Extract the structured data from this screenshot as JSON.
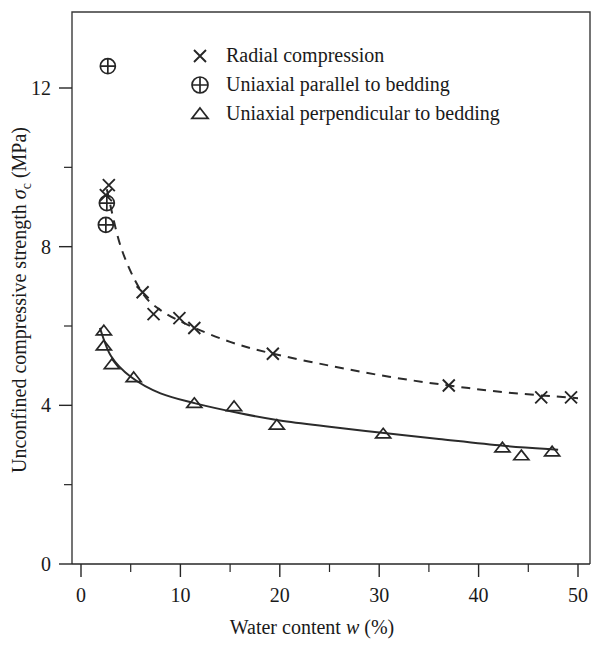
{
  "chart_data": {
    "type": "scatter",
    "title": "",
    "xlabel": "Water content w (%)",
    "xlabel_parts": {
      "pre": "Water content ",
      "italic": "w",
      "post": " (%)"
    },
    "ylabel": "Unconfined compressive strength σc (MPa)",
    "ylabel_parts": {
      "pre": "Unconfined compressive strength ",
      "symbol": "σ",
      "subscript": "c",
      "post": " (MPa)"
    },
    "xlim": [
      0,
      50
    ],
    "ylim": [
      0,
      13.4
    ],
    "x_ticks": [
      0,
      10,
      20,
      30,
      40,
      50
    ],
    "x_tick_labels": [
      "0",
      "10",
      "20",
      "30",
      "40",
      "50"
    ],
    "x_minor_ticks": [
      5,
      15,
      25,
      35,
      45
    ],
    "y_ticks": [
      0,
      4,
      8,
      12
    ],
    "y_tick_labels": [
      "0",
      "4",
      "8",
      "12"
    ],
    "y_minor_ticks": [
      2,
      6,
      10
    ],
    "grid": false,
    "legend_position": "top-center",
    "series": [
      {
        "name": "Radial compression",
        "marker": "cross",
        "line_style": "dashed",
        "points": [
          {
            "x": 2.8,
            "y": 9.55
          },
          {
            "x": 2.5,
            "y": 9.3
          },
          {
            "x": 6.2,
            "y": 6.85
          },
          {
            "x": 7.3,
            "y": 6.3
          },
          {
            "x": 9.9,
            "y": 6.2
          },
          {
            "x": 11.4,
            "y": 5.95
          },
          {
            "x": 19.3,
            "y": 5.3
          },
          {
            "x": 37.0,
            "y": 4.5
          },
          {
            "x": 46.3,
            "y": 4.2
          },
          {
            "x": 49.3,
            "y": 4.2
          }
        ],
        "fit_curve": [
          {
            "x": 2.6,
            "y": 9.45
          },
          {
            "x": 4.0,
            "y": 8.0
          },
          {
            "x": 6.0,
            "y": 6.9
          },
          {
            "x": 8.0,
            "y": 6.4
          },
          {
            "x": 11.0,
            "y": 6.0
          },
          {
            "x": 15.0,
            "y": 5.6
          },
          {
            "x": 19.0,
            "y": 5.32
          },
          {
            "x": 25.0,
            "y": 5.0
          },
          {
            "x": 31.0,
            "y": 4.72
          },
          {
            "x": 37.0,
            "y": 4.5
          },
          {
            "x": 43.0,
            "y": 4.32
          },
          {
            "x": 50.0,
            "y": 4.18
          }
        ]
      },
      {
        "name": "Uniaxial parallel to bedding",
        "marker": "circle-plus",
        "line_style": "none",
        "points": [
          {
            "x": 2.7,
            "y": 12.55
          },
          {
            "x": 2.6,
            "y": 9.1
          },
          {
            "x": 2.5,
            "y": 8.55
          }
        ]
      },
      {
        "name": "Uniaxial perpendicular to bedding",
        "marker": "triangle",
        "line_style": "solid",
        "points": [
          {
            "x": 2.3,
            "y": 5.88
          },
          {
            "x": 2.3,
            "y": 5.5
          },
          {
            "x": 3.1,
            "y": 5.03
          },
          {
            "x": 5.3,
            "y": 4.7
          },
          {
            "x": 11.4,
            "y": 4.05
          },
          {
            "x": 15.4,
            "y": 3.97
          },
          {
            "x": 19.7,
            "y": 3.5
          },
          {
            "x": 30.4,
            "y": 3.28
          },
          {
            "x": 42.4,
            "y": 2.93
          },
          {
            "x": 44.3,
            "y": 2.73
          },
          {
            "x": 47.4,
            "y": 2.83
          }
        ],
        "fit_curve": [
          {
            "x": 1.9,
            "y": 5.95
          },
          {
            "x": 3.0,
            "y": 5.25
          },
          {
            "x": 5.0,
            "y": 4.72
          },
          {
            "x": 8.0,
            "y": 4.3
          },
          {
            "x": 11.5,
            "y": 4.05
          },
          {
            "x": 16.0,
            "y": 3.8
          },
          {
            "x": 20.0,
            "y": 3.62
          },
          {
            "x": 25.0,
            "y": 3.46
          },
          {
            "x": 30.5,
            "y": 3.3
          },
          {
            "x": 36.0,
            "y": 3.15
          },
          {
            "x": 42.5,
            "y": 2.98
          },
          {
            "x": 48.0,
            "y": 2.88
          }
        ]
      }
    ],
    "legend": [
      {
        "label": "Radial compression",
        "marker": "cross"
      },
      {
        "label": "Uniaxial parallel to bedding",
        "marker": "circle-plus"
      },
      {
        "label": "Uniaxial perpendicular to bedding",
        "marker": "triangle"
      }
    ],
    "colors": {
      "axis": "#262626",
      "marker": "#262626",
      "curve": "#2b2b2b",
      "background": "#ffffff"
    }
  }
}
